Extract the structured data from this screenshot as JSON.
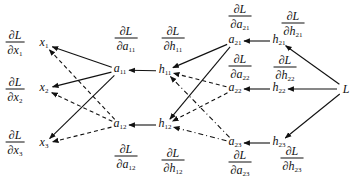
{
  "diagram": {
    "title": "",
    "nodes": {
      "x1": {
        "var": "x",
        "sub": "1",
        "x": 44,
        "y": 44
      },
      "x2": {
        "var": "x",
        "sub": "2",
        "x": 44,
        "y": 89
      },
      "x3": {
        "var": "x",
        "sub": "3",
        "x": 44,
        "y": 144
      },
      "a11": {
        "var": "a",
        "sub": "11",
        "x": 120,
        "y": 70
      },
      "a12": {
        "var": "a",
        "sub": "12",
        "x": 120,
        "y": 125
      },
      "h11": {
        "var": "h",
        "sub": "11",
        "x": 165,
        "y": 71
      },
      "h12": {
        "var": "h",
        "sub": "12",
        "x": 165,
        "y": 125
      },
      "a21": {
        "var": "a",
        "sub": "21",
        "x": 235,
        "y": 41
      },
      "a22": {
        "var": "a",
        "sub": "22",
        "x": 235,
        "y": 89
      },
      "a23": {
        "var": "a",
        "sub": "23",
        "x": 235,
        "y": 143
      },
      "h21": {
        "var": "h",
        "sub": "21",
        "x": 279,
        "y": 41
      },
      "h22": {
        "var": "h",
        "sub": "22",
        "x": 279,
        "y": 89
      },
      "h23": {
        "var": "h",
        "sub": "23",
        "x": 279,
        "y": 143
      },
      "L": {
        "var": "L",
        "sub": "",
        "x": 346,
        "y": 89
      }
    },
    "gradients": {
      "dx1": {
        "num": "∂L",
        "den_d": "∂",
        "den_var": "x",
        "den_sub": "1",
        "x": 15,
        "y": 44
      },
      "dx2": {
        "num": "∂L",
        "den_d": "∂",
        "den_var": "x",
        "den_sub": "2",
        "x": 15,
        "y": 91
      },
      "dx3": {
        "num": "∂L",
        "den_d": "∂",
        "den_var": "x",
        "den_sub": "3",
        "x": 15,
        "y": 144
      },
      "da11": {
        "num": "∂L",
        "den_d": "∂",
        "den_var": "a",
        "den_sub": "11",
        "x": 126,
        "y": 40
      },
      "da12": {
        "num": "∂L",
        "den_d": "∂",
        "den_var": "a",
        "den_sub": "12",
        "x": 126,
        "y": 158
      },
      "dh11": {
        "num": "∂L",
        "den_d": "∂",
        "den_var": "h",
        "den_sub": "11",
        "x": 173,
        "y": 40
      },
      "dh12": {
        "num": "∂L",
        "den_d": "∂",
        "den_var": "h",
        "den_sub": "12",
        "x": 173,
        "y": 162
      },
      "da21": {
        "num": "∂L",
        "den_d": "∂",
        "den_var": "a",
        "den_sub": "21",
        "x": 240,
        "y": 18
      },
      "da22": {
        "num": "∂L",
        "den_d": "∂",
        "den_var": "a",
        "den_sub": "22",
        "x": 240,
        "y": 68
      },
      "da23": {
        "num": "∂L",
        "den_d": "∂",
        "den_var": "a",
        "den_sub": "23",
        "x": 240,
        "y": 164
      },
      "dh21": {
        "num": "∂L",
        "den_d": "∂",
        "den_var": "h",
        "den_sub": "21",
        "x": 293,
        "y": 25
      },
      "dh22": {
        "num": "∂L",
        "den_d": "∂",
        "den_var": "h",
        "den_sub": "22",
        "x": 285,
        "y": 69
      },
      "dh23": {
        "num": "∂L",
        "den_d": "∂",
        "den_var": "h",
        "den_sub": "23",
        "x": 292,
        "y": 160
      }
    },
    "edges": [
      {
        "from": "L",
        "to": "h21",
        "style": "solid"
      },
      {
        "from": "L",
        "to": "h22",
        "style": "solid"
      },
      {
        "from": "L",
        "to": "h23",
        "style": "solid"
      },
      {
        "from": "h21",
        "to": "a21",
        "style": "solid"
      },
      {
        "from": "h22",
        "to": "a22",
        "style": "solid"
      },
      {
        "from": "h23",
        "to": "a23",
        "style": "solid"
      },
      {
        "from": "a21",
        "to": "h11",
        "style": "solid"
      },
      {
        "from": "a21",
        "to": "h12",
        "style": "solid"
      },
      {
        "from": "a22",
        "to": "h11",
        "style": "dashed"
      },
      {
        "from": "a22",
        "to": "h12",
        "style": "dashed"
      },
      {
        "from": "a23",
        "to": "h11",
        "style": "dashdot"
      },
      {
        "from": "a23",
        "to": "h12",
        "style": "dashdot"
      },
      {
        "from": "h11",
        "to": "a11",
        "style": "solid"
      },
      {
        "from": "h12",
        "to": "a12",
        "style": "solid"
      },
      {
        "from": "a11",
        "to": "x1",
        "style": "solid"
      },
      {
        "from": "a11",
        "to": "x2",
        "style": "solid"
      },
      {
        "from": "a11",
        "to": "x3",
        "style": "solid"
      },
      {
        "from": "a12",
        "to": "x1",
        "style": "dashed"
      },
      {
        "from": "a12",
        "to": "x2",
        "style": "dashed"
      },
      {
        "from": "a12",
        "to": "x3",
        "style": "dashed"
      }
    ],
    "colors": {
      "ink": "#111111",
      "background": "#ffffff"
    }
  }
}
